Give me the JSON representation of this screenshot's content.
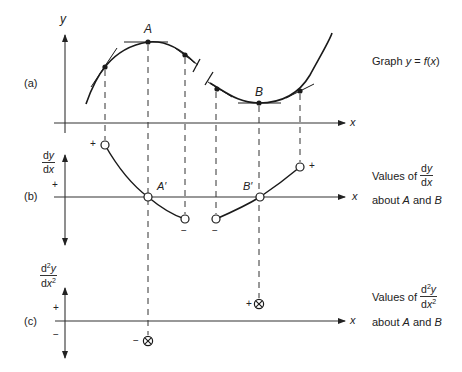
{
  "panels": {
    "a": {
      "tag": "(a)",
      "y_axis_label": "y",
      "x_axis_label": "x",
      "point_A": "A",
      "point_B": "B",
      "caption": {
        "prefix": "Graph ",
        "y": "y",
        "eq": " = ",
        "f": "f",
        "open": "(",
        "x": "x",
        "close": ")"
      }
    },
    "b": {
      "tag": "(b)",
      "axis_num": "dy",
      "axis_num_d": "d",
      "axis_num_y": "y",
      "axis_den_d": "d",
      "axis_den_x": "x",
      "plus_axis": "+",
      "x_axis_label": "x",
      "point_A": "A′",
      "point_B": "B′",
      "sign_left_plus": "+",
      "sign_mid_minus_1": "−",
      "sign_mid_minus_2": "−",
      "sign_right_plus": "+",
      "caption": {
        "values_of": "Values of",
        "frac_num_d": "d",
        "frac_num_y": "y",
        "frac_den_d": "d",
        "frac_den_x": "x",
        "about": "about ",
        "A": "A",
        "and": " and ",
        "B": "B"
      }
    },
    "c": {
      "tag": "(c)",
      "axis_num_d": "d",
      "axis_num_sup": "2",
      "axis_num_y": "y",
      "axis_den_d": "d",
      "axis_den_x": "x",
      "axis_den_sup": "2",
      "plus_axis": "+",
      "minus_axis": "−",
      "x_axis_label": "x",
      "sign_A": "−",
      "sign_B": "+",
      "caption": {
        "values_of": "Values of",
        "frac_num_d": "d",
        "frac_num_sup": "2",
        "frac_num_y": "y",
        "frac_den_d": "d",
        "frac_den_x": "x",
        "frac_den_sup": "2",
        "about": "about ",
        "A": "A",
        "and": " and ",
        "B": "B"
      }
    }
  },
  "colors": {
    "ink": "#1a1a1a",
    "axis": "#333333",
    "background": "#ffffff"
  }
}
